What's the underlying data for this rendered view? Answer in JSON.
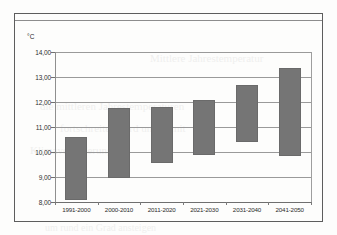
{
  "chart_data": {
    "type": "bar",
    "bar_style": "floating-range",
    "title": "",
    "subtitle": "",
    "xlabel": "",
    "ylabel": "°C",
    "unit_label": "°C",
    "categories": [
      "1991-2000",
      "2000-2010",
      "2011-2020",
      "2021-2030",
      "2031-2040",
      "2041-2050"
    ],
    "series": [
      {
        "name": "Temperaturbereich",
        "low": [
          8.1,
          8.95,
          9.55,
          9.9,
          10.4,
          9.85
        ],
        "high": [
          10.6,
          11.75,
          11.8,
          12.07,
          12.7,
          13.35
        ]
      }
    ],
    "ylim": [
      8.0,
      14.0
    ],
    "ytick_values": [
      8.0,
      9.0,
      10.0,
      11.0,
      12.0,
      13.0,
      14.0
    ],
    "ytick_labels": [
      "8,00",
      "9,00",
      "10,00",
      "11,00",
      "12,00",
      "13,00",
      "14,00"
    ],
    "ytick_step": 1.0,
    "grid": true,
    "grid_axis": "y",
    "legend": false,
    "legend_position": "none",
    "bar_color": "#757575",
    "grid_color": "#9a9a9a",
    "frame_color": "#5d5d5d",
    "text_color": "#2b2b2b",
    "decimal_separator": ","
  },
  "background_text": [
    {
      "text": "Mittlere Jahrestemperatur",
      "x": 150,
      "y": 60,
      "size": 11
    },
    {
      "text": "die mittleren Jahrestemperaturen",
      "x": 40,
      "y": 108,
      "size": 11
    },
    {
      "text": "fortschreiten wird und damit",
      "x": 60,
      "y": 130,
      "size": 11
    },
    {
      "text": "Klimaveränderung",
      "x": 30,
      "y": 152,
      "size": 11
    },
    {
      "text": "um rund ein Grad ansteigen",
      "x": 45,
      "y": 222,
      "size": 10
    }
  ]
}
